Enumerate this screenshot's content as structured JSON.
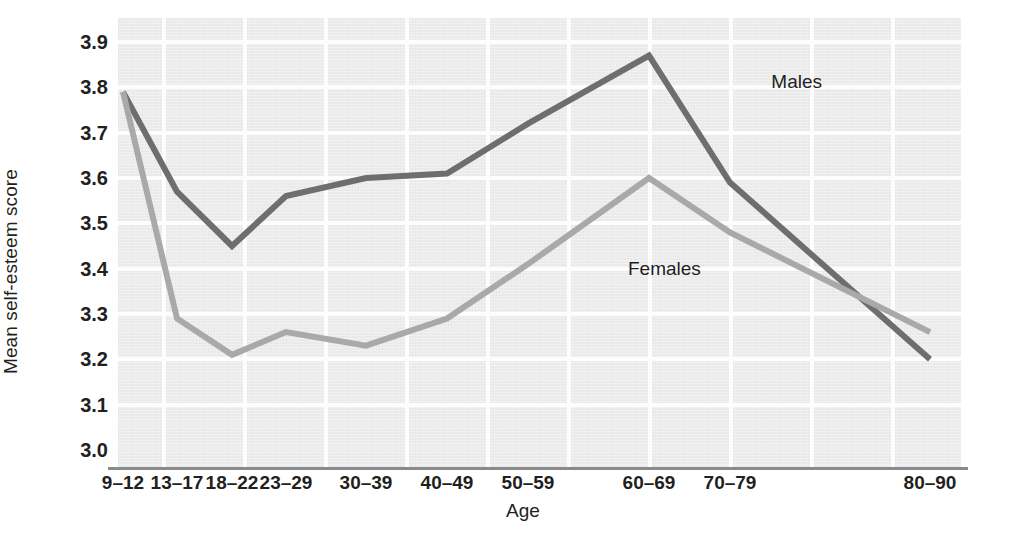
{
  "chart_data": {
    "type": "line",
    "title": "",
    "xlabel": "Age",
    "ylabel": "Mean self-esteem score",
    "categories": [
      "9–12",
      "13–17",
      "18–22",
      "23–29",
      "30–39",
      "40–49",
      "50–59",
      "60–69",
      "70–79",
      "80–90"
    ],
    "ylim": [
      3.0,
      3.9
    ],
    "yticks": [
      "3.0",
      "3.1",
      "3.2",
      "3.3",
      "3.4",
      "3.5",
      "3.6",
      "3.7",
      "3.8",
      "3.9"
    ],
    "ytick_values": [
      3.0,
      3.1,
      3.2,
      3.3,
      3.4,
      3.5,
      3.6,
      3.7,
      3.8,
      3.9
    ],
    "grid": true,
    "legend_position": "inline-annotation",
    "series": [
      {
        "name": "Males",
        "color": "#6e6e6e",
        "values": [
          3.79,
          3.57,
          3.45,
          3.56,
          3.6,
          3.61,
          3.72,
          3.87,
          3.59,
          3.2
        ]
      },
      {
        "name": "Females",
        "color": "#a9a9a9",
        "values": [
          3.79,
          3.29,
          3.21,
          3.26,
          3.23,
          3.29,
          3.41,
          3.6,
          3.48,
          3.26
        ]
      }
    ],
    "annotations": [
      {
        "text": "Males",
        "x_pct": 77.5,
        "y_pct": 12.0
      },
      {
        "text": "Females",
        "x_pct": 60.5,
        "y_pct": 53.5
      }
    ]
  },
  "style": {
    "plot_background": "#ececec",
    "gridline_color": "#fdfdfd",
    "axis_color": "#8a8a8a",
    "text_color": "#231f20"
  }
}
